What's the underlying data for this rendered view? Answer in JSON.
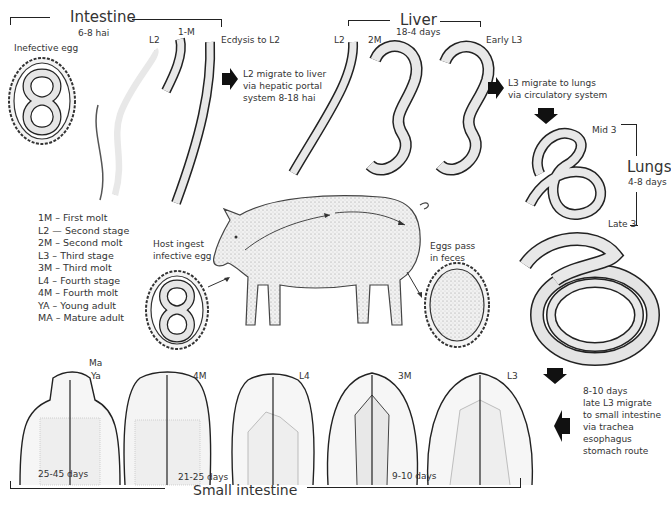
{
  "intestine_top": {
    "label": "Intestine",
    "time": "6-8 hai"
  },
  "liver": {
    "label": "Liver",
    "time": "18-4 days"
  },
  "lungs": {
    "label": "Lungs",
    "time": "4-8 days"
  },
  "small_intestine": {
    "label": "Small intestine"
  },
  "stage_labels": {
    "infective_egg": "Inefective egg",
    "l2_intestine": "L2",
    "m1": "1-M",
    "ecdysis": "Ecdysis to L2",
    "l2_liver": "L2",
    "m2": "2M",
    "early_l3": "Early L3",
    "mid3": "Mid 3",
    "late3": "Late 3",
    "ma": "Ma",
    "ya": "Ya",
    "m4": "4M",
    "l4": "L4",
    "m3": "3M",
    "l3": "L3"
  },
  "notes": {
    "to_liver": [
      "L2 migrate to liver",
      "via hepatic portal",
      "system 8-18 hai"
    ],
    "to_lungs": [
      "L3 migrate to lungs",
      "via circulatory system"
    ],
    "to_intestine": [
      "8-10 days",
      "late L3 migrate",
      "to small intestine",
      "via trachea",
      "esophagus",
      "stomach route"
    ],
    "host_ingest": [
      "Host ingest",
      "infective egg"
    ],
    "eggs_pass": [
      "Eggs pass",
      "in feces"
    ]
  },
  "durations": {
    "d1": "25-45 days",
    "d2": "21-25 days",
    "d3": "9-10 days"
  },
  "legend": [
    "1M – First molt",
    "L2 — Second stage",
    "2M –  Second molt",
    "L3 –  Third stage",
    "3M – Third molt",
    "L4 –  Fourth stage",
    "4M –  Fourth molt",
    "YA – Young adult",
    "MA – Mature adult"
  ]
}
